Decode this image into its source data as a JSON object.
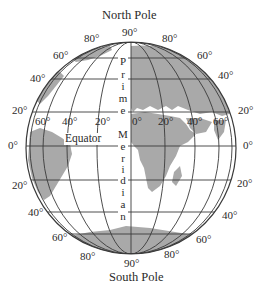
{
  "diagram": {
    "title_top": "North Pole",
    "title_bottom": "South Pole",
    "equator_label": "Equator",
    "prime_meridian_label": [
      "P",
      "r",
      "i",
      "m",
      "e",
      "M",
      "e",
      "r",
      "i",
      "d",
      "i",
      "a",
      "n"
    ],
    "top_labels": {
      "center": "90°",
      "left80": "80°",
      "right80": "80°"
    },
    "bottom_labels": {
      "center": "90°",
      "left80": "80°",
      "right80": "80°"
    },
    "left_latitudes": [
      "60°",
      "40°",
      "20°",
      "0°",
      "20°",
      "40°",
      "60°"
    ],
    "right_latitudes": [
      "60°",
      "40°",
      "20°",
      "0°",
      "20°",
      "40°",
      "60°"
    ],
    "longitude_labels": [
      "60°",
      "40°",
      "20°",
      "0°",
      "20°",
      "40°",
      "60°"
    ],
    "colors": {
      "land": "#a9a9a9",
      "lines": "#3a3a3a",
      "ocean": "#ffffff",
      "text": "#2a2a2a"
    }
  }
}
